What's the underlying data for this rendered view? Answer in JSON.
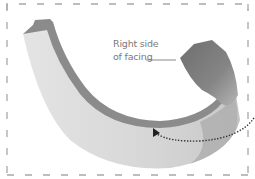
{
  "diagram": {
    "annotation": {
      "line1": "Right side",
      "line2": "of facing"
    },
    "colors": {
      "facing_light": "#dcdcdc",
      "facing_edge": "#8a8a8a",
      "facing_dark": "#7d7d7d",
      "border_dash": "#a8a8a8",
      "label_text": "#7a7a7a",
      "arrow": "#333333"
    },
    "elements": [
      "curved-facing-strip",
      "folded-end-right-side",
      "dashed-frame",
      "leader-line",
      "dotted-curved-arrow"
    ]
  }
}
